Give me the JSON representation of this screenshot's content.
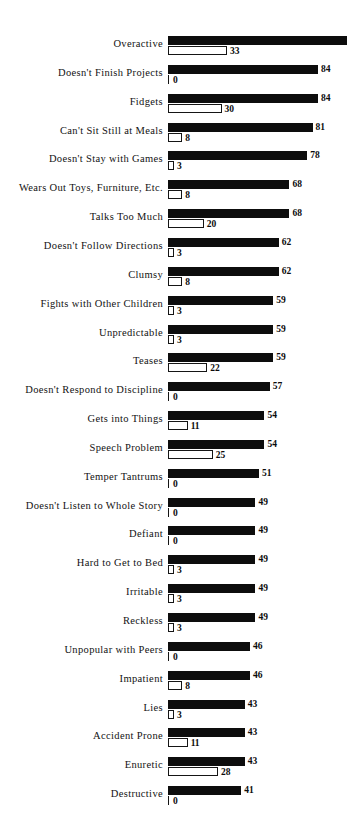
{
  "chart_data": {
    "type": "bar",
    "orientation": "horizontal",
    "title": "",
    "subtitle": "",
    "xlabel": "",
    "ylabel": "",
    "grid": false,
    "legend_position": "none",
    "axis_visible": false,
    "xlim": [
      0,
      100
    ],
    "categories": [
      "Overactive",
      "Doesn't Finish Projects",
      "Fidgets",
      "Can't Sit Still at Meals",
      "Doesn't Stay with Games",
      "Wears Out Toys, Furniture, Etc.",
      "Talks Too Much",
      "Doesn't Follow Directions",
      "Clumsy",
      "Fights with Other Children",
      "Unpredictable",
      "Teases",
      "Doesn't Respond to Discipline",
      "Gets into Things",
      "Speech Problem",
      "Temper Tantrums",
      "Doesn't Listen to Whole Story",
      "Defiant",
      "Hard to Get to Bed",
      "Irritable",
      "Reckless",
      "Unpopular with Peers",
      "Impatient",
      "Lies",
      "Accident Prone",
      "Enuretic",
      "Destructive"
    ],
    "series": [
      {
        "name": "filled-bar",
        "style": "solid-black",
        "color": "#0d0d0d",
        "values": [
          100,
          84,
          84,
          81,
          78,
          68,
          68,
          62,
          62,
          59,
          59,
          59,
          57,
          54,
          54,
          51,
          49,
          49,
          49,
          49,
          49,
          46,
          46,
          43,
          43,
          43,
          41
        ],
        "labels": [
          "",
          "84",
          "84",
          "81",
          "78",
          "68",
          "68",
          "62",
          "62",
          "59",
          "59",
          "59",
          "57",
          "54",
          "54",
          "51",
          "49",
          "49",
          "49",
          "49",
          "49",
          "46",
          "46",
          "43",
          "43",
          "43",
          "41"
        ]
      },
      {
        "name": "outlined-bar",
        "style": "white-outline",
        "color": "#ffffff",
        "values": [
          33,
          0,
          30,
          8,
          3,
          8,
          20,
          3,
          8,
          3,
          3,
          22,
          0,
          11,
          25,
          0,
          0,
          0,
          3,
          3,
          3,
          0,
          8,
          3,
          11,
          28,
          0
        ],
        "labels": [
          "33",
          "0",
          "30",
          "8",
          "3",
          "8",
          "20",
          "3",
          "8",
          "3",
          "3",
          "22",
          "0",
          "11",
          "25",
          "0",
          "0",
          "0",
          "3",
          "3",
          "3",
          "0",
          "8",
          "3",
          "11",
          "28",
          "0"
        ]
      }
    ]
  },
  "colors": {
    "bar_filled": "#0d0d0d",
    "bar_outline": "#151515",
    "bar_outline_fill": "#ffffff",
    "text": "#121212",
    "background": "#ffffff"
  }
}
